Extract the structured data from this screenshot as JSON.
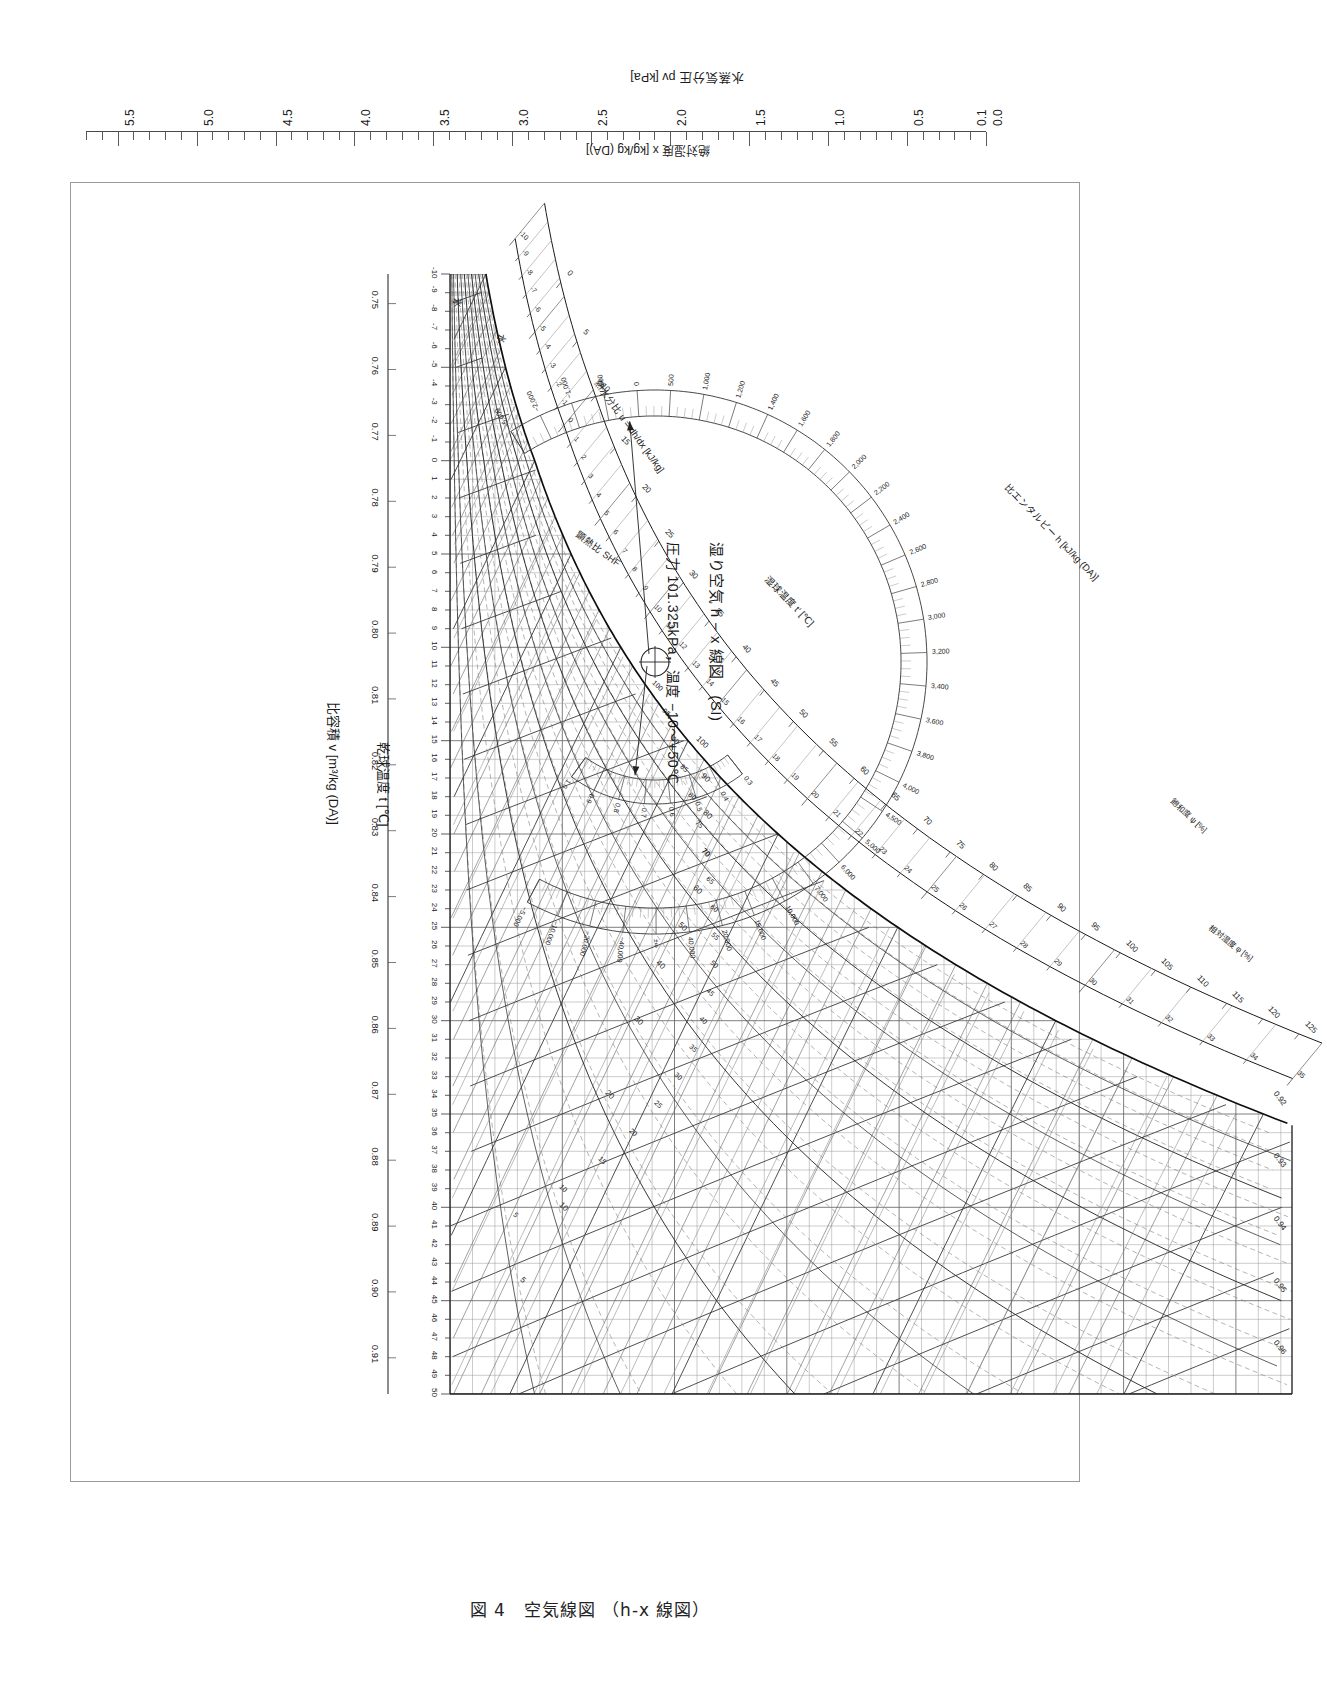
{
  "figure": {
    "caption": "図 4　空気線図 （h-x 線図）",
    "title_main": "湿り空気 h − x 線図　(SI)",
    "title_sub": "圧力 101.325kPa，温度 −10〜+50℃"
  },
  "axes": {
    "vapor_pressure": {
      "title": "水蒸気分圧 pv [kPa]",
      "ticks": [
        "0.0",
        "0.1",
        "0.5",
        "1.0",
        "1.5",
        "2.0",
        "2.5",
        "3.0",
        "3.5",
        "4.0",
        "4.5",
        "5.0",
        "5.5"
      ],
      "min": 0.0,
      "max": 5.7,
      "minor_step": 0.1
    },
    "humidity_ratio": {
      "title": "絶対湿度 x [kg/kg (DA)]",
      "ticks": [
        "0.000",
        "0.001",
        "0.002",
        "0.003",
        "0.004",
        "0.005",
        "0.006",
        "0.007",
        "0.008",
        "0.009",
        "0.010",
        "0.011",
        "0.012",
        "0.013",
        "0.014",
        "0.015",
        "0.016",
        "0.017",
        "0.018",
        "0.019",
        "0.020",
        "0.021",
        "0.022",
        "0.023",
        "0.024",
        "0.025",
        "0.026",
        "0.027",
        "0.028",
        "0.029",
        "0.030",
        "0.031",
        "0.032",
        "0.033",
        "0.034",
        "0.035",
        "0.036",
        "0.037"
      ],
      "min": 0.0,
      "max": 0.0375,
      "unit": "kg/kg (DA)"
    },
    "dry_bulb": {
      "title": "乾球温度 t [℃]",
      "unit": "℃",
      "min": -10,
      "max": 50,
      "ticks": [
        "-10",
        "-9",
        "-8",
        "-7",
        "-6",
        "-5",
        "-4",
        "-3",
        "-2",
        "-1",
        "0",
        "1",
        "2",
        "3",
        "4",
        "5",
        "6",
        "7",
        "8",
        "9",
        "10",
        "11",
        "12",
        "13",
        "14",
        "15",
        "16",
        "17",
        "18",
        "19",
        "20",
        "21",
        "22",
        "23",
        "24",
        "25",
        "26",
        "27",
        "28",
        "29",
        "30",
        "31",
        "32",
        "33",
        "34",
        "35",
        "36",
        "37",
        "38",
        "39",
        "40",
        "41",
        "42",
        "43",
        "44",
        "45",
        "46",
        "47",
        "48",
        "49",
        "50"
      ]
    },
    "wet_bulb": {
      "title": "湿球温度 t′ [℃]",
      "unit": "℃",
      "min": -10,
      "max": 35,
      "ticks": [
        "-10",
        "-9",
        "-8",
        "-7",
        "-6",
        "-5",
        "-4",
        "-3",
        "-2",
        "-1",
        "0",
        "1",
        "2",
        "3",
        "4",
        "5",
        "6",
        "7",
        "8",
        "9",
        "10",
        "11",
        "12",
        "13",
        "14",
        "15",
        "16",
        "17",
        "18",
        "19",
        "20",
        "21",
        "22",
        "23",
        "24",
        "25",
        "26",
        "27",
        "28",
        "29",
        "30",
        "31",
        "32",
        "33",
        "34",
        "35"
      ]
    },
    "enthalpy": {
      "title": "比エンタルピー h [kJ/kg (DA)]",
      "unit": "kJ/kg (DA)",
      "min": -10,
      "max": 125,
      "ticks": [
        "0",
        "5",
        "10",
        "15",
        "20",
        "25",
        "30",
        "35",
        "40",
        "45",
        "50",
        "55",
        "60",
        "65",
        "70",
        "75",
        "80",
        "85",
        "90",
        "95",
        "100",
        "105",
        "110",
        "115",
        "120",
        "125"
      ]
    },
    "specific_volume": {
      "title": "比容積 v [m³/kg (DA)]",
      "unit": "m³/kg (DA)",
      "ticks": [
        "0.75",
        "0.76",
        "0.77",
        "0.78",
        "0.79",
        "0.80",
        "0.81",
        "0.82",
        "0.83",
        "0.84",
        "0.85",
        "0.86",
        "0.87",
        "0.88",
        "0.89",
        "0.90",
        "0.91"
      ],
      "inner_ticks": [
        "0.92",
        "0.93",
        "0.94",
        "0.95",
        "0.96"
      ]
    }
  },
  "curves": {
    "relative_humidity": {
      "title": "相対湿度 φ [%]",
      "labels": [
        "5",
        "10",
        "20",
        "30",
        "40",
        "50",
        "60",
        "70",
        "80",
        "90",
        "100"
      ]
    },
    "saturation_degree": {
      "title": "飽和度 ψ [%]",
      "labels": [
        "5",
        "10",
        "15",
        "20",
        "25",
        "30",
        "35",
        "40",
        "45",
        "50",
        "55",
        "60",
        "65",
        "70",
        "75",
        "80",
        "85",
        "90",
        "95",
        "100"
      ]
    }
  },
  "phase_labels": {
    "water": "水",
    "ice": "氷"
  },
  "protractor": {
    "heat_moisture_ratio": {
      "label": "熱水分比 u = dh/dx  [kJ/kg]",
      "ticks": [
        "−5,000",
        "−2,000",
        "−1,000",
        "−500",
        "0",
        "500",
        "1,000",
        "1,200",
        "1,400",
        "1,600",
        "1,800",
        "2,000",
        "2,200",
        "2,400",
        "2,600",
        "2,800",
        "3,000",
        "3,200",
        "3,400",
        "3,600",
        "3,800",
        "4,000",
        "4,500",
        "5,000",
        "6,000",
        "7,000",
        "10,000",
        "15,000",
        "20,000",
        "40,000",
        "±∞",
        "−40,000",
        "−20,000",
        "−10,000",
        "−5,000"
      ]
    },
    "shf": {
      "label": "顕熱比 SHF",
      "ticks": [
        "1.0",
        "0.9",
        "0.8",
        "0.7",
        "0.6",
        "0.5",
        "0.4",
        "0.3"
      ]
    }
  },
  "chart_data": {
    "type": "line",
    "subtitle": "圧力 101.325kPa，温度 −10〜+50℃",
    "xlabel": "乾球温度 t [℃]",
    "ylabel": "絶対湿度 x [kg/kg (DA)]",
    "xlim": [
      -10,
      50
    ],
    "ylim": [
      0.0,
      0.0375
    ],
    "grid": true,
    "legend": "none",
    "series": [
      {
        "name": "飽和曲線 φ=100%",
        "x": [
          -10,
          -5,
          0,
          5,
          10,
          15,
          20,
          25,
          30,
          35,
          40,
          45,
          50
        ],
        "values": [
          0.0016,
          0.0025,
          0.0038,
          0.0054,
          0.0076,
          0.0107,
          0.0147,
          0.0202,
          0.0273,
          0.0366,
          0.0491,
          0.0654,
          0.0866
        ]
      },
      {
        "name": "φ=90%",
        "x": [
          -10,
          0,
          10,
          20,
          30,
          40,
          50
        ],
        "values": [
          0.0014,
          0.0034,
          0.0069,
          0.0132,
          0.0245,
          0.0437,
          0.0761
        ]
      },
      {
        "name": "φ=80%",
        "x": [
          -10,
          0,
          10,
          20,
          30,
          40,
          50
        ],
        "values": [
          0.0013,
          0.003,
          0.0061,
          0.0117,
          0.0217,
          0.0388,
          0.0678
        ]
      },
      {
        "name": "φ=70%",
        "x": [
          -10,
          0,
          10,
          20,
          30,
          40,
          50
        ],
        "values": [
          0.0011,
          0.0027,
          0.0053,
          0.0103,
          0.019,
          0.0339,
          0.0592
        ]
      },
      {
        "name": "φ=60%",
        "x": [
          -10,
          0,
          10,
          20,
          30,
          40,
          50
        ],
        "values": [
          0.001,
          0.0023,
          0.0046,
          0.0088,
          0.0163,
          0.0291,
          0.0508
        ]
      },
      {
        "name": "φ=50%",
        "x": [
          -10,
          0,
          10,
          20,
          30,
          40,
          50
        ],
        "values": [
          0.0008,
          0.0019,
          0.0038,
          0.0073,
          0.0136,
          0.0243,
          0.0424
        ]
      },
      {
        "name": "φ=40%",
        "x": [
          -10,
          0,
          10,
          20,
          30,
          40,
          50
        ],
        "values": [
          0.0006,
          0.0015,
          0.003,
          0.0059,
          0.0109,
          0.0194,
          0.0339
        ]
      },
      {
        "name": "φ=30%",
        "x": [
          -10,
          0,
          10,
          20,
          30,
          40,
          50
        ],
        "values": [
          0.0005,
          0.0011,
          0.0023,
          0.0044,
          0.0082,
          0.0146,
          0.0255
        ]
      },
      {
        "name": "φ=20%",
        "x": [
          -10,
          0,
          10,
          20,
          30,
          40,
          50
        ],
        "values": [
          0.0003,
          0.0008,
          0.0015,
          0.0029,
          0.0055,
          0.0097,
          0.017
        ]
      },
      {
        "name": "φ=10%",
        "x": [
          -10,
          0,
          10,
          20,
          30,
          40,
          50
        ],
        "values": [
          0.0002,
          0.0004,
          0.0008,
          0.0015,
          0.0027,
          0.0049,
          0.0085
        ]
      },
      {
        "name": "φ=5%",
        "x": [
          -10,
          0,
          10,
          20,
          30,
          40,
          50
        ],
        "values": [
          0.0001,
          0.0002,
          0.0004,
          0.0007,
          0.0014,
          0.0024,
          0.0043
        ]
      }
    ],
    "isolines": {
      "enthalpy_kJ_per_kg": [
        0,
        5,
        10,
        15,
        20,
        25,
        30,
        35,
        40,
        45,
        50,
        55,
        60,
        65,
        70,
        75,
        80,
        85,
        90,
        95,
        100,
        105,
        110,
        115,
        120,
        125
      ],
      "wet_bulb_C": [
        -10,
        -5,
        0,
        5,
        10,
        15,
        20,
        25,
        30,
        35
      ],
      "specific_volume_m3_per_kg": [
        0.75,
        0.78,
        0.8,
        0.82,
        0.84,
        0.86,
        0.88,
        0.9,
        0.92,
        0.94,
        0.96
      ]
    }
  }
}
